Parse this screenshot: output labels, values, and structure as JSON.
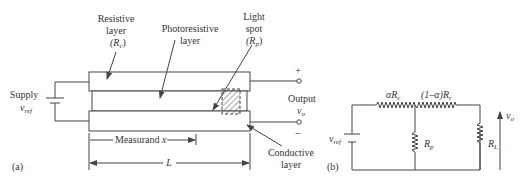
{
  "diagram_a": {
    "panel_label": "(a)",
    "labels": {
      "resistive_line1": "Resistive",
      "resistive_line2": "layer",
      "resistive_symbol": "(R",
      "resistive_sub": "c",
      "resistive_close": ")",
      "photo_line1": "Photoresistive",
      "photo_line2": "layer",
      "light_line1": "Light",
      "light_line2": "spot",
      "light_symbol": "(R",
      "light_sub": "p",
      "light_close": ")",
      "supply_line1": "Supply",
      "supply_symbol": "v",
      "supply_sub": "ref",
      "output_line1": "Output",
      "output_symbol": "v",
      "output_sub": "o",
      "plus": "+",
      "minus": "–",
      "conductive_line1": "Conductive",
      "conductive_line2": "layer",
      "measurand": "Measurand ",
      "measurand_var": "x",
      "length": "L"
    }
  },
  "diagram_b": {
    "panel_label": "(b)",
    "labels": {
      "alpha_rc": "αR",
      "alpha_rc_sub": "c",
      "one_minus_alpha_rc": "(1–α)R",
      "one_minus_alpha_rc_sub": "c",
      "rp": "R",
      "rp_sub": "p",
      "rl": "R",
      "rl_sub": "L",
      "vref": "v",
      "vref_sub": "ref",
      "vo": "v",
      "vo_sub": "o"
    }
  },
  "colors": {
    "stroke": "#444444",
    "text": "#333333",
    "background": "#ffffff"
  }
}
